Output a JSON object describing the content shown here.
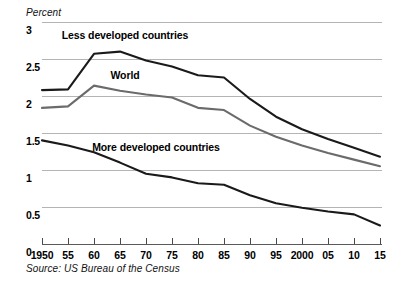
{
  "chart_data": {
    "type": "line",
    "title": "",
    "ylabel": "Percent",
    "xlabel": "",
    "ylim": [
      0,
      3
    ],
    "xlim": [
      1950,
      2015
    ],
    "grid": true,
    "legend_position": "inline-annotations",
    "source_note": "Source: US Bureau of the Census",
    "y_ticks": [
      "3",
      "2.5",
      "2",
      "1.5",
      "1",
      "0.5",
      "0"
    ],
    "y_tick_values": [
      3,
      2.5,
      2,
      1.5,
      1,
      0.5,
      0
    ],
    "x_tick_labels": [
      "1950",
      "55",
      "60",
      "65",
      "70",
      "75",
      "80",
      "85",
      "90",
      "95",
      "2000",
      "05",
      "10",
      "15"
    ],
    "x": [
      1950,
      1955,
      1960,
      1965,
      1970,
      1975,
      1980,
      1985,
      1990,
      1995,
      2000,
      2005,
      2010,
      2015
    ],
    "series": [
      {
        "name": "Less developed countries",
        "color": "#1a1a1a",
        "values": [
          2.08,
          2.09,
          2.57,
          2.6,
          2.48,
          2.4,
          2.28,
          2.25,
          1.96,
          1.72,
          1.55,
          1.42,
          1.3,
          1.18
        ]
      },
      {
        "name": "World",
        "color": "#6b6b6b",
        "values": [
          1.84,
          1.86,
          2.14,
          2.07,
          2.02,
          1.98,
          1.84,
          1.81,
          1.6,
          1.45,
          1.33,
          1.23,
          1.14,
          1.05
        ]
      },
      {
        "name": "More developed countries",
        "color": "#1a1a1a",
        "values": [
          1.4,
          1.33,
          1.24,
          1.1,
          0.95,
          0.9,
          0.82,
          0.8,
          0.66,
          0.55,
          0.49,
          0.44,
          0.4,
          0.25
        ]
      }
    ],
    "annotations": [
      {
        "text": "Less developed countries",
        "x": 1966,
        "y": 2.82
      },
      {
        "text": "World",
        "x": 1966,
        "y": 2.29
      },
      {
        "text": "More developed countries",
        "x": 1972,
        "y": 1.31
      }
    ]
  }
}
